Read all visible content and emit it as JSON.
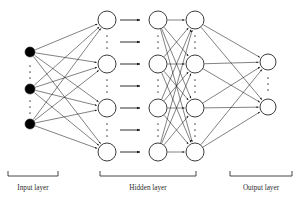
{
  "figure": {
    "type": "diagram",
    "background_color": "#ffffff",
    "stroke_color": "#1a1a1a",
    "node_fill_open": "#ffffff",
    "node_fill_filled": "#000000",
    "ellipsis_color": "#555555",
    "label_color": "#2b2b2b"
  },
  "labels": {
    "input": "Input layer",
    "hidden": "Hidden layer",
    "output": "Output layer"
  },
  "caption_fragment": "the network model",
  "layers": [
    {
      "id": "input",
      "name": "Input layer",
      "node_style": "filled",
      "node_radius": 5,
      "visible_node_count": 3,
      "cx": 30,
      "node_y": [
        52,
        89,
        124
      ],
      "ellipses": [
        {
          "x": 30,
          "y": [
            66,
            72,
            78
          ]
        },
        {
          "x": 30,
          "y": [
            101,
            107,
            113
          ]
        }
      ],
      "bracket": {
        "x1": 8,
        "x2": 58,
        "y": 176
      },
      "label_x": 33,
      "label_y": 184
    },
    {
      "id": "hidden-1",
      "name": "Hidden layer column 1",
      "node_style": "open",
      "node_radius": 9,
      "visible_node_count": 4,
      "cx": 107,
      "node_y": [
        20,
        64,
        108,
        152
      ],
      "ellipses": [
        {
          "x": 107,
          "y": [
            36,
            42,
            48
          ]
        },
        {
          "x": 107,
          "y": [
            80,
            86,
            92
          ]
        },
        {
          "x": 107,
          "y": [
            124,
            130,
            136
          ]
        }
      ]
    },
    {
      "id": "hidden-2",
      "name": "Hidden layer column 2",
      "node_style": "open",
      "node_radius": 9,
      "visible_node_count": 4,
      "cx": 158,
      "node_y": [
        20,
        64,
        108,
        152
      ],
      "ellipses": [
        {
          "x": 158,
          "y": [
            36,
            42,
            48
          ]
        },
        {
          "x": 158,
          "y": [
            80,
            86,
            92
          ]
        },
        {
          "x": 158,
          "y": [
            124,
            130,
            136
          ]
        }
      ]
    },
    {
      "id": "hidden-3",
      "name": "Hidden layer column 3",
      "node_style": "open",
      "node_radius": 9,
      "visible_node_count": 4,
      "cx": 195,
      "node_y": [
        20,
        64,
        108,
        152
      ],
      "ellipses": [
        {
          "x": 195,
          "y": [
            36,
            42,
            48
          ]
        },
        {
          "x": 195,
          "y": [
            80,
            86,
            92
          ]
        },
        {
          "x": 195,
          "y": [
            124,
            130,
            136
          ]
        }
      ]
    },
    {
      "id": "output",
      "name": "Output layer",
      "node_style": "open",
      "node_radius": 8,
      "visible_node_count": 2,
      "cx": 268,
      "node_y": [
        62,
        107
      ],
      "ellipses": [
        {
          "x": 268,
          "y": [
            78,
            84,
            90
          ]
        }
      ],
      "bracket": {
        "x1": 230,
        "x2": 292,
        "y": 176
      },
      "label_x": 261,
      "label_y": 184
    }
  ],
  "hidden_bracket": {
    "x1": 100,
    "x2": 196,
    "y": 176,
    "label_x": 148,
    "label_y": 184
  },
  "connector_arrows": {
    "name": "inter-column arrows",
    "count": 7,
    "x_start": 120,
    "x_end": 140,
    "y": [
      20,
      42,
      64,
      86,
      108,
      130,
      152
    ]
  },
  "edge_groups": [
    {
      "from": "input",
      "to": "hidden-1",
      "description": "fully connected, arrowheads at hidden-1",
      "from_y": [
        52,
        89,
        124
      ],
      "to_y": [
        20,
        64,
        108,
        152
      ]
    },
    {
      "from": "hidden-2",
      "to": "hidden-3",
      "description": "fully connected, arrowheads at hidden-3",
      "from_y": [
        20,
        64,
        108,
        152
      ],
      "to_y": [
        20,
        64,
        108,
        152
      ]
    },
    {
      "from": "hidden-3",
      "to": "output",
      "description": "fully connected, arrowheads at output",
      "from_y": [
        20,
        64,
        108,
        152
      ],
      "to_y": [
        62,
        107
      ]
    }
  ]
}
